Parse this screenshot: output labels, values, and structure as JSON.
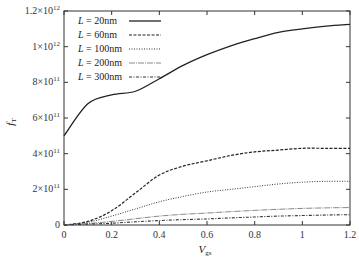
{
  "chart_data": {
    "type": "line",
    "title": "",
    "xlabel": "V_gs",
    "ylabel": "f_T",
    "xlim": [
      0,
      1.2
    ],
    "ylim": [
      0,
      1200000000000.0
    ],
    "grid": false,
    "legend_position": "upper-left",
    "x_ticks": [
      "0",
      "0.2",
      "0.4",
      "0.6",
      "0.8",
      "1",
      "1.2"
    ],
    "y_ticks": [
      "0",
      "2×10¹¹",
      "4×10¹¹",
      "6×10¹¹",
      "8×10¹¹",
      "1×10¹²",
      "1.2×10¹²"
    ],
    "x": [
      0,
      0.1,
      0.2,
      0.3,
      0.4,
      0.5,
      0.6,
      0.7,
      0.8,
      0.9,
      1.0,
      1.1,
      1.2
    ],
    "series": [
      {
        "name": "L = 20nm",
        "style": "solid",
        "values": [
          500000000000.0,
          680000000000.0,
          730000000000.0,
          750000000000.0,
          820000000000.0,
          895000000000.0,
          955000000000.0,
          1005000000000.0,
          1045000000000.0,
          1080000000000.0,
          1100000000000.0,
          1115000000000.0,
          1125000000000.0
        ]
      },
      {
        "name": "L = 60nm",
        "style": "dashed",
        "values": [
          0,
          20000000000.0,
          80000000000.0,
          180000000000.0,
          280000000000.0,
          330000000000.0,
          360000000000.0,
          390000000000.0,
          410000000000.0,
          420000000000.0,
          430000000000.0,
          430000000000.0,
          430000000000.0
        ]
      },
      {
        "name": "L = 100nm",
        "style": "dotted",
        "values": [
          0,
          15000000000.0,
          50000000000.0,
          90000000000.0,
          130000000000.0,
          160000000000.0,
          185000000000.0,
          200000000000.0,
          215000000000.0,
          230000000000.0,
          240000000000.0,
          245000000000.0,
          245000000000.0
        ]
      },
      {
        "name": "L = 200nm",
        "style": "dash-dot-light",
        "values": [
          0,
          8000000000.0,
          20000000000.0,
          35000000000.0,
          50000000000.0,
          60000000000.0,
          67000000000.0,
          75000000000.0,
          82000000000.0,
          88000000000.0,
          93000000000.0,
          96000000000.0,
          98000000000.0
        ]
      },
      {
        "name": "L = 300nm",
        "style": "dash-dot",
        "values": [
          0,
          5000000000.0,
          10000000000.0,
          18000000000.0,
          25000000000.0,
          30000000000.0,
          34000000000.0,
          40000000000.0,
          45000000000.0,
          50000000000.0,
          53000000000.0,
          56000000000.0,
          58000000000.0
        ]
      }
    ]
  }
}
